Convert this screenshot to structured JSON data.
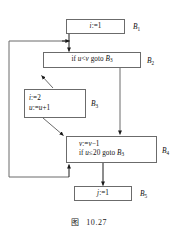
{
  "figure": {
    "caption_label": "图",
    "caption_number": "10.27"
  },
  "blocks": [
    {
      "id": "B1",
      "label": "B",
      "label_sub": "1",
      "lines": [
        "i:=1"
      ],
      "align": "center"
    },
    {
      "id": "B2",
      "label": "B",
      "label_sub": "2",
      "lines": [
        "if u<v goto B3"
      ],
      "align": "center"
    },
    {
      "id": "B3",
      "label": "B",
      "label_sub": "3",
      "lines": [
        "i:=2",
        "u:=u+1"
      ],
      "align": "left"
    },
    {
      "id": "B4",
      "label": "B",
      "label_sub": "4",
      "lines": [
        "v:=v-1",
        "if u≤20 goto B3"
      ],
      "align": "left"
    },
    {
      "id": "B5",
      "label": "B",
      "label_sub": "5",
      "lines": [
        "j:=1"
      ],
      "align": "center"
    }
  ],
  "edges": [
    {
      "name": "edge-b1-to-b2",
      "from": "B1",
      "to": "B2"
    },
    {
      "name": "edge-b2-to-b3",
      "from": "B2",
      "to": "B3"
    },
    {
      "name": "edge-b2-to-b4",
      "from": "B2",
      "to": "B4"
    },
    {
      "name": "edge-b3-to-b4",
      "from": "B3",
      "to": "B4"
    },
    {
      "name": "edge-b4-to-b5",
      "from": "B4",
      "to": "B5"
    },
    {
      "name": "edge-b4-loop-back-to-b2",
      "from": "B4",
      "to": "B2"
    },
    {
      "name": "edge-loop-arrow-into-b4",
      "from": "loop",
      "to": "B4"
    }
  ],
  "colors": {
    "stroke": "#6b6b6b",
    "arrow": "#1a1a1a",
    "text": "#111111",
    "background": "#ffffff"
  }
}
